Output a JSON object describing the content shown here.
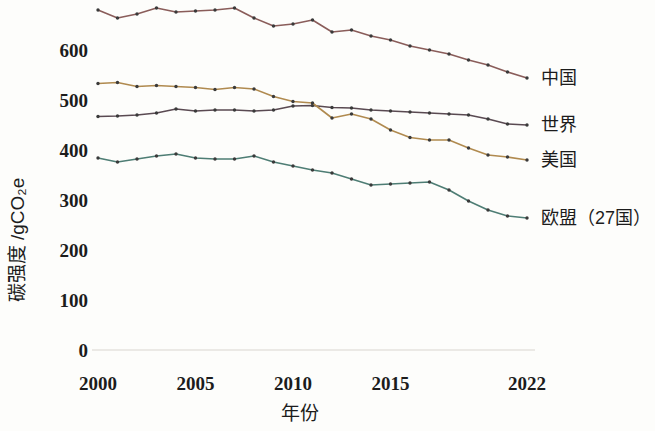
{
  "chart_data": {
    "type": "line",
    "title": "",
    "xlabel": "年份",
    "ylabel": "碳强度 /gCO₂e",
    "x": [
      2000,
      2001,
      2002,
      2003,
      2004,
      2005,
      2006,
      2007,
      2008,
      2009,
      2010,
      2011,
      2012,
      2013,
      2014,
      2015,
      2016,
      2017,
      2018,
      2019,
      2020,
      2021,
      2022
    ],
    "xlim": [
      2000,
      2022
    ],
    "ylim": [
      0,
      700
    ],
    "xticks": [
      "2000",
      "2005",
      "2010",
      "2015",
      "2022"
    ],
    "xtick_values": [
      2000,
      2005,
      2010,
      2015,
      2022
    ],
    "yticks": [
      "600",
      "500",
      "400",
      "300",
      "200",
      "100",
      "0"
    ],
    "ytick_values": [
      600,
      500,
      400,
      300,
      200,
      100,
      0
    ],
    "grid": false,
    "legend_position": "right",
    "series": [
      {
        "name": "中国",
        "color": "#8a5d5a",
        "values": [
          680,
          664,
          672,
          684,
          676,
          678,
          680,
          684,
          664,
          648,
          652,
          660,
          636,
          640,
          628,
          620,
          608,
          600,
          592,
          580,
          570,
          556,
          544
        ]
      },
      {
        "name": "世界",
        "color": "#5a4a52",
        "values": [
          467,
          468,
          470,
          474,
          482,
          478,
          480,
          480,
          478,
          480,
          488,
          489,
          485,
          484,
          480,
          478,
          476,
          474,
          472,
          470,
          462,
          452,
          450
        ]
      },
      {
        "name": "美国",
        "color": "#b08a4f",
        "values": [
          533,
          535,
          527,
          529,
          527,
          525,
          521,
          525,
          522,
          507,
          497,
          494,
          464,
          472,
          462,
          440,
          425,
          420,
          420,
          404,
          390,
          386,
          380
        ]
      },
      {
        "name": "欧盟（27国）",
        "color": "#4e7d74",
        "values": [
          384,
          376,
          382,
          388,
          392,
          384,
          382,
          382,
          388,
          376,
          368,
          360,
          354,
          342,
          330,
          332,
          334,
          336,
          320,
          298,
          280,
          268,
          264
        ]
      }
    ]
  },
  "axis": {
    "y_label": "碳强度 /gCO₂e",
    "x_label": "年份"
  }
}
